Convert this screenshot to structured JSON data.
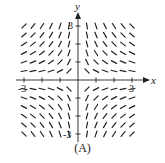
{
  "figure": {
    "caption": "(A)",
    "x_axis_label": "x",
    "y_axis_label": "y",
    "tick_labels": {
      "x_neg": "-3",
      "x_pos": "3",
      "y_pos": "3",
      "y_neg": "-3"
    }
  },
  "chart_data": {
    "type": "slope_field",
    "equation": "dy/dx = -y/x",
    "xlim": [
      -3,
      3
    ],
    "ylim": [
      -3,
      3
    ],
    "grid_step": 0.5,
    "x_values": [
      -3,
      -2.5,
      -2,
      -1.5,
      -1,
      -0.5,
      0.5,
      1,
      1.5,
      2,
      2.5,
      3
    ],
    "y_values": [
      -3,
      -2.5,
      -2,
      -1.5,
      -1,
      -0.5,
      0.5,
      1,
      1.5,
      2,
      2.5,
      3
    ],
    "ticks": [
      -3,
      -2,
      -1,
      1,
      2,
      3
    ],
    "xlabel": "x",
    "ylabel": "y",
    "caption": "(A)"
  },
  "style": {
    "ink": "#222222",
    "background": "#ffffff"
  }
}
